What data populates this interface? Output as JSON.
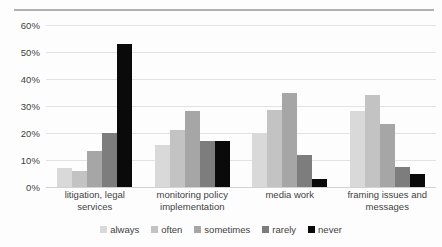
{
  "chart_data": {
    "type": "bar",
    "title": "",
    "subtitle": "",
    "xlabel": "",
    "ylabel": "",
    "ylim": [
      0,
      60
    ],
    "ytick_labels": [
      "60%",
      "50%",
      "40%",
      "30%",
      "20%",
      "10%",
      "0%"
    ],
    "ytick_values": [
      60,
      50,
      40,
      30,
      20,
      10,
      0
    ],
    "grid": true,
    "legend_position": "bottom",
    "categories": [
      "litigation, legal services",
      "monitoring policy implementation",
      "media work",
      "framing issues and messages"
    ],
    "series": [
      {
        "name": "always",
        "color": "#d9d9d9",
        "values": [
          7,
          15.5,
          20,
          28
        ]
      },
      {
        "name": "often",
        "color": "#c3c3c3",
        "values": [
          6,
          21,
          28.5,
          34
        ]
      },
      {
        "name": "sometimes",
        "color": "#a6a6a6",
        "values": [
          13.5,
          28,
          35,
          23.5
        ]
      },
      {
        "name": "rarely",
        "color": "#7d7d7d",
        "values": [
          20,
          17,
          12,
          7.5
        ]
      },
      {
        "name": "never",
        "color": "#0a0a0a",
        "values": [
          53,
          17,
          3,
          5
        ]
      }
    ]
  }
}
